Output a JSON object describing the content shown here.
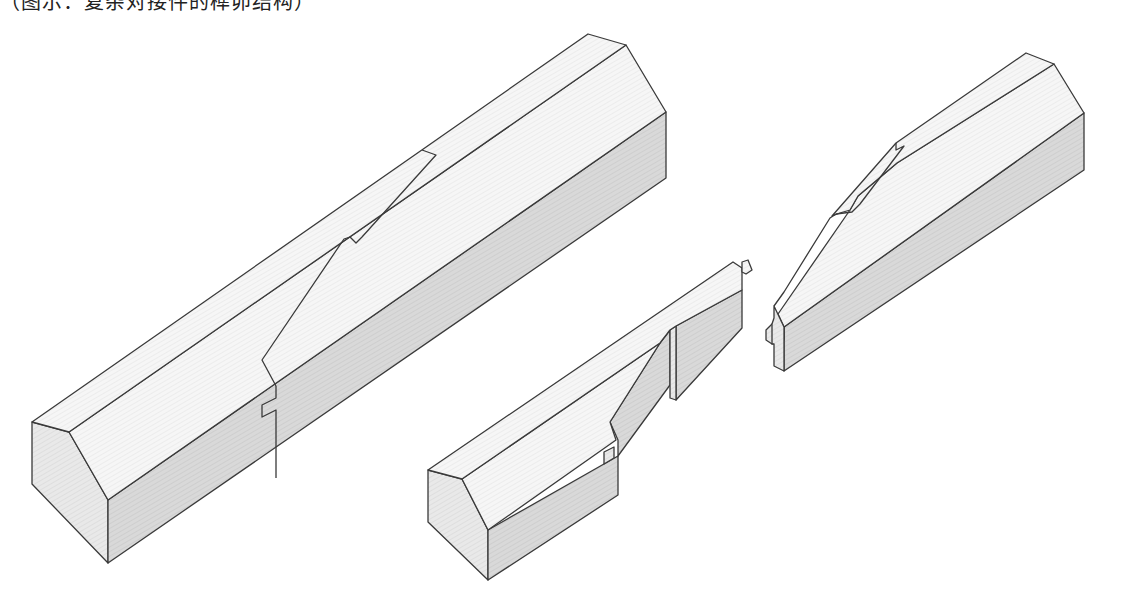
{
  "caption": {
    "text": "（图示：复杂对接件的榫卯结构）",
    "note": "top line of text is cropped at the image edge"
  },
  "figure": {
    "colors": {
      "outline": "#3a3a3a",
      "top_face": "#f4f4f4",
      "side_face": "#d6d6d6",
      "end_face": "#e6e6e6",
      "background": "#ffffff"
    },
    "parts": [
      {
        "id": "assembled-beam",
        "label": "assembled beam"
      },
      {
        "id": "lower-half",
        "label": "lower half with tenon"
      },
      {
        "id": "upper-half",
        "label": "upper half with notch"
      }
    ]
  }
}
